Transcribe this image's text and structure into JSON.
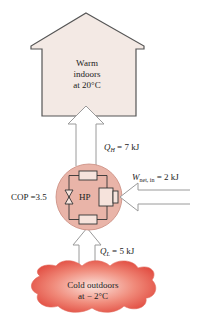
{
  "diagram": {
    "warm_region": {
      "line1": "Warm",
      "line2": "indoors",
      "line3": "at 20°C",
      "fill": "#f3e9e4"
    },
    "cold_region": {
      "line1": "Cold outdoors",
      "line2": "at − 2°C",
      "fill": "#e8584a"
    },
    "heat_pump": {
      "label": "HP",
      "fill": "#e9b4a8",
      "cop_label": "COP =3.5"
    },
    "flows": {
      "q_high": {
        "symbol": "Q",
        "subscript": "H",
        "value": "= 7 kJ"
      },
      "w_net": {
        "symbol": "W",
        "subscript": "net, in",
        "value": "= 2 kJ"
      },
      "q_low": {
        "symbol": "Q",
        "subscript": "L",
        "value": "= 5 kJ"
      }
    }
  }
}
